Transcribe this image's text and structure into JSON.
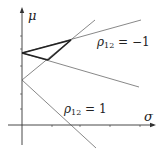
{
  "figure": {
    "y_axis_label": "μ",
    "x_axis_label": "σ",
    "labels": {
      "rho_neg": {
        "sym": "ρ",
        "sub": "12",
        "rest": " = −1"
      },
      "rho_pos": {
        "sym": "ρ",
        "sub": "12",
        "rest": " = 1"
      }
    },
    "colors": {
      "axis": "#333333",
      "line": "#555555",
      "bold": "#222222",
      "background": "#ffffff"
    }
  }
}
